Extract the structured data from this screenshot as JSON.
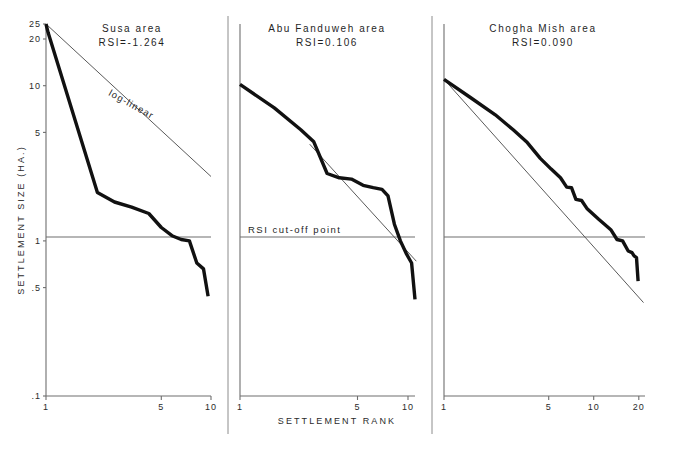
{
  "figure": {
    "width": 675,
    "height": 449,
    "background": "#ffffff",
    "ink_color": "#111111",
    "rule_color": "#6e6e6e",
    "xlabel": "SETTLEMENT RANK",
    "ylabel": "SETTLEMENT SIZE (HA.)"
  },
  "chart_data": {
    "type": "line",
    "title": "",
    "xlabel": "SETTLEMENT RANK",
    "ylabel": "SETTLEMENT SIZE (HA.)",
    "xscale": "log",
    "yscale": "log",
    "grid": false,
    "legend": null,
    "ytick_labels": [
      "25",
      "20",
      "10",
      "5",
      "1",
      ".5",
      ".1"
    ],
    "ytick_values": [
      25,
      20,
      10,
      5,
      1,
      0.5,
      0.1
    ],
    "ylim": [
      0.1,
      25
    ],
    "annotations": [
      {
        "text": "log-linear",
        "panel": 0
      },
      {
        "text": "RSI cut-off point",
        "panel": 1
      }
    ],
    "panels": [
      {
        "name": "Susa area",
        "title_line1": "Susa area",
        "title_line2": "RSI=-1.264",
        "rsi": -1.264,
        "xtick_labels": [
          "1",
          "5",
          "10"
        ],
        "xtick_values": [
          1,
          5,
          10
        ],
        "xlim": [
          1,
          10
        ],
        "fit_label": "log-linear",
        "cutoff_label": null,
        "fit_line": {
          "x": [
            1,
            10
          ],
          "y": [
            25,
            2.6
          ]
        },
        "series": [
          {
            "name": "rank-size curve",
            "x": [
              1,
              1.03,
              2.05,
              2.6,
              3.3,
              4.2,
              5.0,
              5.8,
              6.6,
              7.4,
              8.2,
              9.0,
              9.6
            ],
            "y": [
              25.0,
              22.0,
              2.05,
              1.78,
              1.65,
              1.5,
              1.22,
              1.08,
              1.02,
              1.0,
              0.72,
              0.66,
              0.44
            ]
          }
        ]
      },
      {
        "name": "Abu Fanduweh area",
        "title_line1": "Abu Fanduweh area",
        "title_line2": "RSI=0.106",
        "rsi": 0.106,
        "xtick_labels": [
          "1",
          "5",
          "10"
        ],
        "xtick_values": [
          1,
          5,
          10
        ],
        "xlim": [
          1,
          11
        ],
        "fit_label": null,
        "cutoff_label": "RSI cut-off point",
        "cutoff_value": 1,
        "fit_line": {
          "x": [
            2.6,
            11.2
          ],
          "y": [
            4.2,
            0.74
          ]
        },
        "series": [
          {
            "name": "rank-size curve",
            "x": [
              1,
              1.6,
              2.3,
              2.75,
              3.3,
              3.9,
              4.6,
              5.4,
              6.2,
              7.0,
              7.6,
              8.3,
              9.0,
              9.8,
              10.5,
              11.0
            ],
            "y": [
              10.2,
              7.2,
              5.2,
              4.35,
              2.72,
              2.55,
              2.5,
              2.28,
              2.2,
              2.15,
              1.95,
              1.28,
              1.0,
              0.82,
              0.72,
              0.42
            ]
          }
        ]
      },
      {
        "name": "Chogha Mish area",
        "title_line1": "Chogha Mish area",
        "title_line2": "RSI=0.090",
        "rsi": 0.09,
        "xtick_labels": [
          "1",
          "5",
          "10",
          "20"
        ],
        "xtick_values": [
          1,
          5,
          10,
          20
        ],
        "xlim": [
          1,
          22
        ],
        "fit_label": null,
        "cutoff_label": null,
        "cutoff_value": 1,
        "fit_line": {
          "x": [
            1,
            21.5
          ],
          "y": [
            11.0,
            0.4
          ]
        },
        "series": [
          {
            "name": "rank-size curve",
            "x": [
              1,
              1.5,
              2.2,
              2.9,
              3.6,
              4.4,
              5.2,
              6.0,
              6.6,
              7.1,
              7.6,
              8.3,
              9.0,
              9.8,
              10.8,
              11.8,
              13.0,
              14.3,
              15.6,
              17.0,
              18.0,
              18.6,
              19.3,
              19.8
            ],
            "y": [
              11.0,
              8.4,
              6.5,
              5.2,
              4.3,
              3.4,
              2.9,
              2.55,
              2.22,
              2.2,
              1.85,
              1.82,
              1.62,
              1.5,
              1.38,
              1.28,
              1.18,
              1.02,
              1.0,
              0.86,
              0.84,
              0.8,
              0.78,
              0.55
            ]
          }
        ]
      }
    ]
  }
}
